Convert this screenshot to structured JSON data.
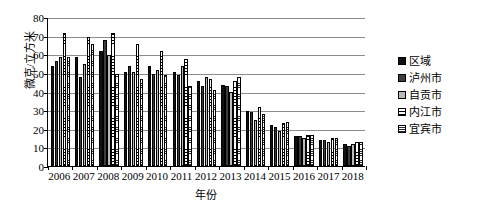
{
  "chart_data": {
    "type": "bar",
    "title": "",
    "xlabel": "年份",
    "ylabel": "微克/立方米",
    "ylim": [
      0,
      80
    ],
    "yticks": [
      0,
      10,
      20,
      30,
      40,
      50,
      60,
      70,
      80
    ],
    "grid": true,
    "legend_position": "right",
    "categories": [
      "2006",
      "2007",
      "2008",
      "2009",
      "2010",
      "2011",
      "2012",
      "2013",
      "2014",
      "2015",
      "2016",
      "2017",
      "2018"
    ],
    "series": [
      {
        "name": "区域",
        "values": [
          54,
          59,
          62,
          51,
          54,
          51,
          46,
          44,
          30,
          22,
          16,
          14,
          12
        ]
      },
      {
        "name": "泸州市",
        "values": [
          57,
          48,
          68,
          54,
          50,
          49,
          43,
          43,
          29,
          21,
          16,
          14,
          11
        ]
      },
      {
        "name": "自贡市",
        "values": [
          59,
          55,
          60,
          51,
          52,
          54,
          48,
          40,
          25,
          19,
          15,
          13,
          12
        ]
      },
      {
        "name": "内江市",
        "values": [
          72,
          70,
          72,
          66,
          62,
          58,
          47,
          46,
          32,
          23,
          17,
          15,
          13
        ]
      },
      {
        "name": "宜宾市",
        "values": [
          59,
          66,
          50,
          47,
          49,
          43,
          41,
          48,
          28,
          24,
          17,
          15,
          13
        ]
      }
    ]
  },
  "legend": {
    "items": [
      {
        "label": "区域",
        "pattern": "solid-black"
      },
      {
        "label": "泸州市",
        "pattern": "solid-dark-gray"
      },
      {
        "label": "自贡市",
        "pattern": "solid-light-gray"
      },
      {
        "label": "内江市",
        "pattern": "horizontal-lines"
      },
      {
        "label": "宜宾市",
        "pattern": "dense-hatch"
      }
    ]
  },
  "colors": {
    "series0": "#111111",
    "series1": "#3d3d3d",
    "series2": "#b9b9b9",
    "series3": "#ffffff",
    "series4": "#ffffff",
    "grid": "#8d8d8d",
    "axis": "#000000",
    "background": "#ffffff"
  }
}
